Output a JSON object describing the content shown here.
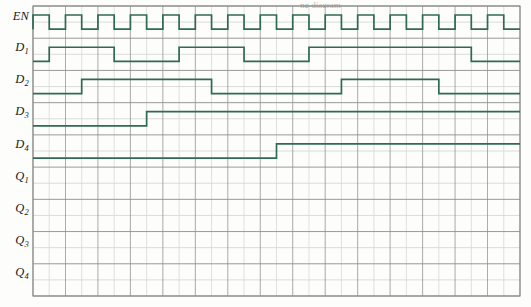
{
  "figure": {
    "type": "digital-timing-diagram",
    "title_fragment": "ng diagram",
    "background_color": "#fdfdfc",
    "wave_color": "#2f6a52",
    "grid_minor_color": "#d8d8d8",
    "grid_major_color": "#8a8a8a",
    "label_color": "#1a1a1a"
  },
  "grid": {
    "left": 33,
    "right": 520,
    "top": 6,
    "bottom": 296,
    "columns": 30,
    "column_width": 16.23,
    "rows": 9,
    "row_height": 32.2,
    "half_row_divider": true
  },
  "signals": [
    {
      "name": "EN",
      "label": "EN",
      "subscript": "",
      "row": 0,
      "kind": "clock",
      "description": "enable clock pulse train, one cell high then one cell low",
      "pulse_start_column": 0,
      "pulse_high_cells": 1,
      "pulse_low_cells": 1,
      "pulse_count": 15,
      "initial_level": 0,
      "transitions": []
    },
    {
      "name": "D1",
      "label": "D",
      "subscript": "1",
      "row": 1,
      "kind": "data",
      "initial_level": 0,
      "transitions": [
        {
          "column": 1,
          "level": 1
        },
        {
          "column": 5,
          "level": 0
        },
        {
          "column": 9,
          "level": 1
        },
        {
          "column": 13,
          "level": 0
        },
        {
          "column": 17,
          "level": 1
        },
        {
          "column": 27,
          "level": 0
        }
      ]
    },
    {
      "name": "D2",
      "label": "D",
      "subscript": "2",
      "row": 2,
      "kind": "data",
      "initial_level": 0,
      "transitions": [
        {
          "column": 3,
          "level": 1
        },
        {
          "column": 11,
          "level": 0
        },
        {
          "column": 19,
          "level": 1
        },
        {
          "column": 25,
          "level": 0
        }
      ]
    },
    {
      "name": "D3",
      "label": "D",
      "subscript": "3",
      "row": 3,
      "kind": "data",
      "initial_level": 0,
      "transitions": [
        {
          "column": 7,
          "level": 1
        }
      ]
    },
    {
      "name": "D4",
      "label": "D",
      "subscript": "4",
      "row": 4,
      "kind": "data",
      "initial_level": 0,
      "transitions": [
        {
          "column": 15,
          "level": 1
        }
      ]
    },
    {
      "name": "Q1",
      "label": "Q",
      "subscript": "1",
      "row": 5,
      "kind": "blank",
      "initial_level": null,
      "transitions": []
    },
    {
      "name": "Q2",
      "label": "Q",
      "subscript": "2",
      "row": 6,
      "kind": "blank",
      "initial_level": null,
      "transitions": []
    },
    {
      "name": "Q3",
      "label": "Q",
      "subscript": "3",
      "row": 7,
      "kind": "blank",
      "initial_level": null,
      "transitions": []
    },
    {
      "name": "Q4",
      "label": "Q",
      "subscript": "4",
      "row": 8,
      "kind": "blank",
      "initial_level": null,
      "transitions": []
    }
  ]
}
